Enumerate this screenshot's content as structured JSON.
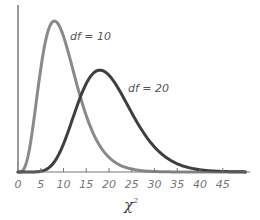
{
  "chart_data": {
    "type": "line",
    "title": "",
    "xlabel": "χ²",
    "ylabel": "",
    "xlim": [
      0,
      50
    ],
    "x_ticks": [
      0,
      5,
      10,
      15,
      20,
      25,
      30,
      35,
      40,
      45
    ],
    "grid": false,
    "legend": "inline labels next to curves",
    "series": [
      {
        "name": "df = 10",
        "distribution": "chi-square",
        "df": 10,
        "color": "#8a8a8a",
        "mode_x": 8,
        "peak_density": 0.0977
      },
      {
        "name": "df = 20",
        "distribution": "chi-square",
        "df": 20,
        "color": "#3f3f3f",
        "mode_x": 18,
        "peak_density": 0.0669
      }
    ]
  },
  "labels": {
    "x_axis": "χ",
    "x_axis_sup": "2",
    "curve1": "df = 10",
    "curve2": "df = 20",
    "ticks": [
      "0",
      "5",
      "10",
      "15",
      "20",
      "25",
      "30",
      "35",
      "40",
      "45"
    ]
  }
}
